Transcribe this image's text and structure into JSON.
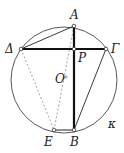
{
  "diagram": {
    "type": "geometry-circle",
    "circle": {
      "name": "κ",
      "cx": 64,
      "cy": 80,
      "r": 53
    },
    "center": {
      "label": "O",
      "x": 64,
      "y": 78
    },
    "points": [
      {
        "id": "A",
        "label": "A",
        "x": 74,
        "y": 26,
        "lx": 70,
        "ly": 19
      },
      {
        "id": "P",
        "label": "P",
        "x": 74,
        "y": 49,
        "lx": 78,
        "ly": 62
      },
      {
        "id": "Delta",
        "label": "Δ",
        "x": 21,
        "y": 49,
        "lx": 5,
        "ly": 53
      },
      {
        "id": "Gamma",
        "label": "Γ",
        "x": 106,
        "y": 49,
        "lx": 111,
        "ly": 53
      },
      {
        "id": "B",
        "label": "B",
        "x": 74,
        "y": 130,
        "lx": 70,
        "ly": 146
      },
      {
        "id": "E",
        "label": "E",
        "x": 54,
        "y": 130,
        "lx": 44,
        "ly": 146
      }
    ],
    "kappa_label": {
      "text": "κ",
      "x": 108,
      "y": 128
    },
    "segments_bold": [
      [
        "Delta",
        "Gamma"
      ],
      [
        "A",
        "B"
      ]
    ],
    "segments_thin": [
      [
        "Delta",
        "A"
      ],
      [
        "Gamma",
        "B"
      ],
      [
        "E",
        "B"
      ]
    ],
    "segments_dashed": [
      [
        "Delta",
        "E"
      ],
      [
        "A",
        "E"
      ]
    ],
    "colors": {
      "line": "#222222",
      "dashed": "#999999",
      "circle": "#444444"
    }
  }
}
